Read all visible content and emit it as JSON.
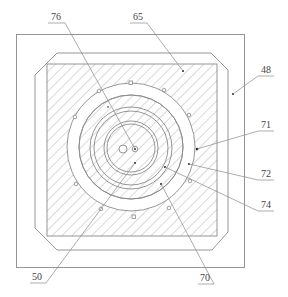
{
  "figure": {
    "type": "patent-cross-section",
    "colors": {
      "line": "#8a8a8a",
      "hatch": "#9a9a9a",
      "text": "#444444",
      "background": "#ffffff"
    }
  },
  "labels": {
    "l76": "76",
    "l65": "65",
    "l48": "48",
    "l71": "71",
    "l72": "72",
    "l74": "74",
    "l50": "50",
    "l70": "70"
  }
}
